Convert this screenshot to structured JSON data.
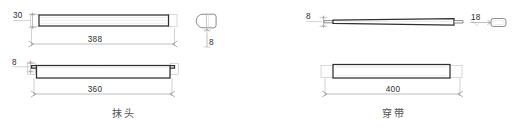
{
  "drawing": {
    "title": "furniture-joinery-detail-sheet",
    "background_color": "#ffffff",
    "line_color_heavy": "#2f2f2f",
    "line_color_thin": "#8a8a8a",
    "text_color": "#2b2b2b",
    "caption_color": "#555555"
  },
  "left_assembly": {
    "caption": "抹头",
    "top_view": {
      "name": "plan-view",
      "height_label": "30",
      "length_dimension": "388"
    },
    "bottom_view": {
      "name": "elevation-view",
      "thickness_label": "8",
      "length_dimension": "360"
    },
    "section": {
      "name": "cross-section-profile",
      "shape": "rounded-square",
      "dimension_label": "8"
    }
  },
  "right_assembly": {
    "caption": "穿带",
    "top_view": {
      "name": "tapered-batten-view",
      "thickness_label": "8",
      "width_label": "18"
    },
    "bottom_view": {
      "name": "plan-view",
      "length_dimension": "400"
    },
    "section": {
      "name": "cross-section-profile",
      "shape": "rounded-rectangle"
    }
  }
}
